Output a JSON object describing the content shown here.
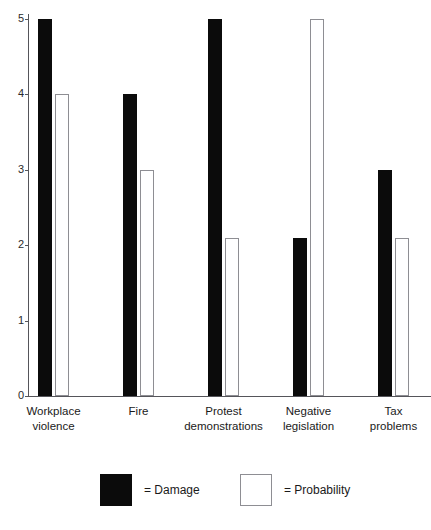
{
  "chart_data": {
    "type": "bar",
    "title": "",
    "subtitle": "",
    "xlabel": "",
    "ylabel": "",
    "ylim": [
      0,
      5
    ],
    "yticks": [
      "0",
      "1",
      "2",
      "3",
      "4",
      "5"
    ],
    "grid": false,
    "legend_position": "bottom",
    "categories": [
      "Workplace\nviolence",
      "Fire",
      "Protest\ndemonstrations",
      "Negative\nlegislation",
      "Tax\nproblems"
    ],
    "category_labels": [
      {
        "line1": "Workplace",
        "line2": "violence"
      },
      {
        "line1": "Fire",
        "line2": ""
      },
      {
        "line1": "Protest",
        "line2": "demonstrations"
      },
      {
        "line1": "Negative",
        "line2": "legislation"
      },
      {
        "line1": "Tax",
        "line2": "problems"
      }
    ],
    "series": [
      {
        "name": "Damage",
        "color": "#0b0b0b",
        "style": "filled",
        "values": [
          5,
          4,
          5,
          2.1,
          3
        ]
      },
      {
        "name": "Probability",
        "color": "#ffffff",
        "style": "hollow",
        "values": [
          4,
          3,
          2.1,
          5,
          2.1
        ]
      }
    ]
  },
  "legend": {
    "entries": [
      {
        "label": "= Damage",
        "swatch": "black-filled-square"
      },
      {
        "label": "= Probability",
        "swatch": "white-hollow-square"
      }
    ]
  }
}
